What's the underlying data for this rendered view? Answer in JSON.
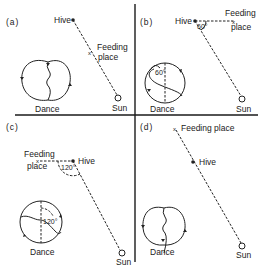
{
  "figure": {
    "colors": {
      "ink": "#222222",
      "background": "#ffffff"
    }
  },
  "panels": [
    {
      "id": "a",
      "label": "(a)",
      "hive_label": "Hive",
      "feeding_label_line1": "Feeding",
      "feeding_label_line2": "place",
      "sun_label": "Sun",
      "dance_label": "Dance",
      "angle_label": ""
    },
    {
      "id": "b",
      "label": "(b)",
      "hive_label": "Hive",
      "feeding_label_line1": "Feeding",
      "feeding_label_line2": "place",
      "sun_label": "Sun",
      "dance_label": "Dance",
      "angle_label": "60°",
      "dance_angle_label": "60°"
    },
    {
      "id": "c",
      "label": "(c)",
      "hive_label": "Hive",
      "feeding_label_line1": "Feeding",
      "feeding_label_line2": "place",
      "sun_label": "Sun",
      "dance_label": "Dance",
      "angle_label": "120°",
      "dance_angle_label": "120°"
    },
    {
      "id": "d",
      "label": "(d)",
      "hive_label": "Hive",
      "feeding_label": "Feeding place",
      "sun_label": "Sun",
      "dance_label": "Dance",
      "angle_label": ""
    }
  ]
}
